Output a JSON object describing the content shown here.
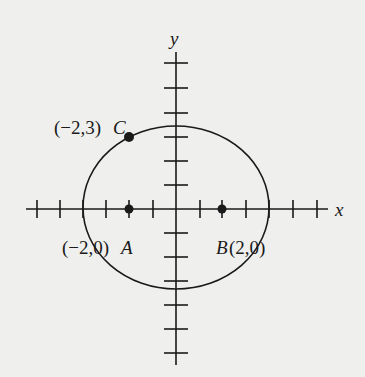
{
  "figure": {
    "axes": {
      "x_label": "x",
      "y_label": "y",
      "origin_px": [
        176,
        209
      ],
      "tick_spacing_px": 23.5
    },
    "curve": {
      "type": "ellipse",
      "center": [
        0,
        0
      ],
      "passes_through": "C"
    },
    "points": [
      {
        "name": "A",
        "coords": "(−2,0)",
        "label_text": "(−2,0)",
        "letter": "A"
      },
      {
        "name": "B",
        "coords": "(2,0)",
        "label_text": "(2,0)",
        "letter": "B"
      },
      {
        "name": "C",
        "coords": "(−2,3)",
        "label_text": "(−2,3)",
        "letter": "C"
      }
    ],
    "colors": {
      "ink": "#1a1a1a",
      "background": "#efefed"
    }
  }
}
